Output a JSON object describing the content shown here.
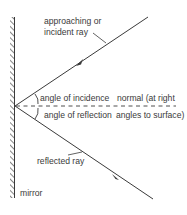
{
  "diagram": {
    "type": "reflection-of-light",
    "labels": {
      "incident_line1": "approaching or",
      "incident_line2": "incident ray",
      "angle_incidence": "angle of incidence",
      "angle_reflection": "angle of reflection",
      "normal_line1": "normal (at right",
      "normal_line2": "angles to surface)",
      "reflected": "reflected ray",
      "mirror": "mirror"
    },
    "colors": {
      "line": "#3a3a3a",
      "background": "#ffffff"
    }
  }
}
